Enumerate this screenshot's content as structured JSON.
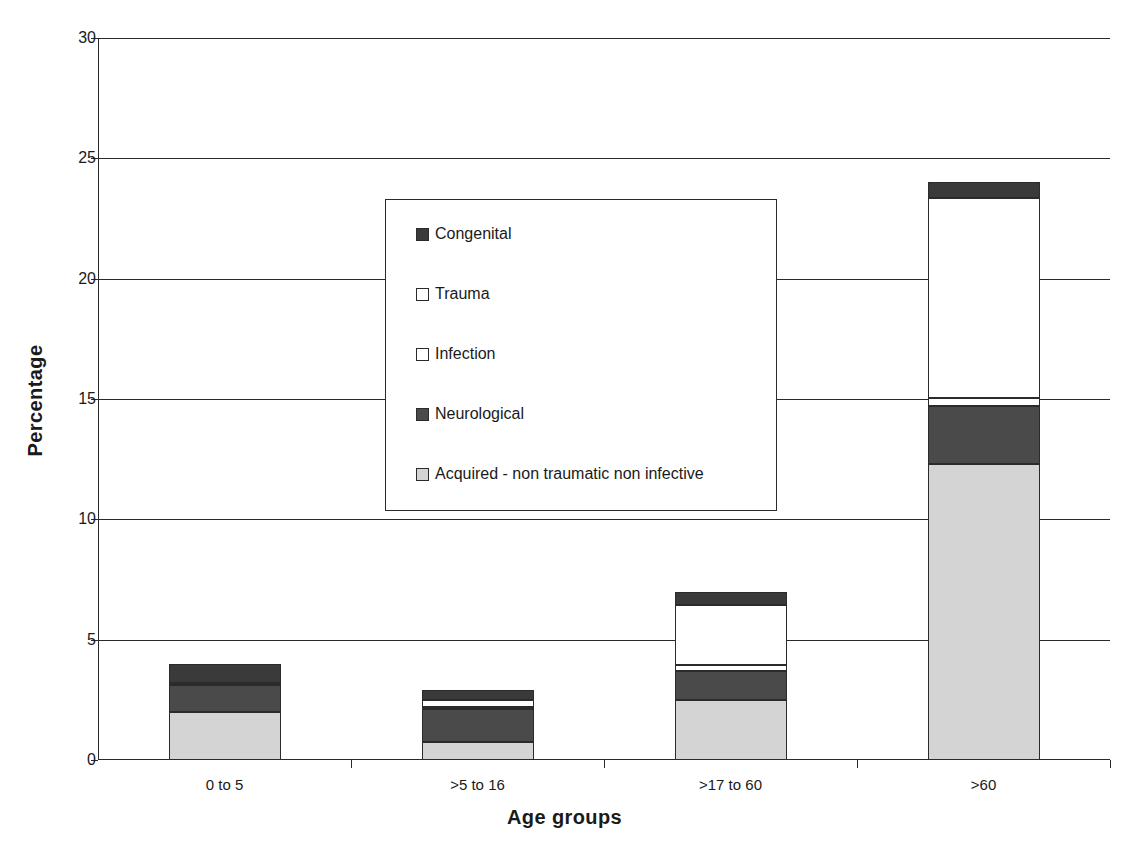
{
  "chart_data": {
    "type": "bar",
    "subtype": "stacked-bar",
    "title": "",
    "xlabel": "Age groups",
    "ylabel": "Percentage",
    "ylim": [
      0,
      30
    ],
    "ytick_step": 5,
    "yticks": [
      "0",
      "5",
      "10",
      "15",
      "20",
      "25",
      "30"
    ],
    "grid": true,
    "grid_axis": "y",
    "legend_position": "center",
    "categories": [
      "0 to 5",
      ">5 to 16",
      ">17 to 60",
      ">60"
    ],
    "series": [
      {
        "name": "Acquired - non traumatic non infective",
        "color": "#d4d4d4",
        "values": [
          2.0,
          0.75,
          2.5,
          12.3
        ]
      },
      {
        "name": "Neurological",
        "color": "#4a4a4a",
        "values": [
          1.1,
          1.35,
          1.2,
          2.4
        ]
      },
      {
        "name": "Infection",
        "color": "#ffffff",
        "values": [
          0.1,
          0.1,
          0.25,
          0.35
        ]
      },
      {
        "name": "Trauma",
        "color": "#ffffff",
        "values": [
          0.0,
          0.3,
          2.5,
          8.3
        ]
      },
      {
        "name": "Congenital",
        "color": "#3a3a3a",
        "values": [
          0.8,
          0.4,
          0.55,
          0.65
        ]
      }
    ],
    "stack_totals": [
      4.0,
      2.9,
      7.0,
      24.0
    ],
    "legend_entries": [
      {
        "label": "Congenital",
        "color": "#3a3a3a"
      },
      {
        "label": "Trauma",
        "color": "#ffffff"
      },
      {
        "label": "Infection",
        "color": "#ffffff"
      },
      {
        "label": "Neurological",
        "color": "#4a4a4a"
      },
      {
        "label": "Acquired - non traumatic non infective",
        "color": "#d4d4d4"
      }
    ]
  },
  "colors": {
    "axis": "#2b2b2b",
    "text": "#1a1a1a",
    "background": "#ffffff"
  }
}
